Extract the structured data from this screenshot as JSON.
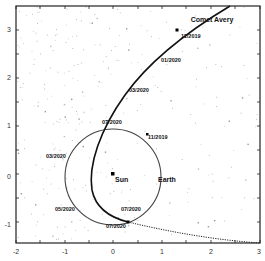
{
  "chart_data": {
    "type": "line",
    "title": "",
    "xlabel": "",
    "ylabel": "",
    "xlim": [
      -2,
      3
    ],
    "ylim": [
      -1.4,
      3.5
    ],
    "grid": false,
    "x_ticks": [
      "-2",
      "-1",
      "0",
      "1",
      "2",
      "3"
    ],
    "y_ticks": [
      "3",
      "2",
      "1",
      "0",
      "-1"
    ],
    "series": [
      {
        "name": "Comet Avery",
        "style": "solid-thick",
        "points": [
          [
            2.4,
            3.5
          ],
          [
            1.5,
            2.9
          ],
          [
            0.7,
            2.25
          ],
          [
            0.1,
            1.7
          ],
          [
            -0.3,
            1.0
          ],
          [
            -0.5,
            0.3
          ],
          [
            -0.45,
            -0.3
          ],
          [
            -0.2,
            -0.65
          ],
          [
            0.15,
            -0.95
          ]
        ]
      },
      {
        "name": "Comet Avery (future)",
        "style": "dotted",
        "points": [
          [
            0.15,
            -0.95
          ],
          [
            1.0,
            -1.15
          ],
          [
            2.0,
            -1.3
          ],
          [
            3.0,
            -1.35
          ]
        ]
      },
      {
        "name": "Earth orbit",
        "style": "circle",
        "center": [
          0,
          0
        ],
        "radius": 1.0
      }
    ],
    "annotations": [
      {
        "text": "Comet Avery",
        "x": 1.55,
        "y": 3.15
      },
      {
        "text": "11/2019",
        "x": 1.55,
        "y": 2.85
      },
      {
        "text": "01/2020",
        "x": 0.75,
        "y": 2.05
      },
      {
        "text": "03/2020",
        "x": 0.15,
        "y": 1.45
      },
      {
        "text": "07/2020",
        "x": -0.2,
        "y": 0.85
      },
      {
        "text": "11/2019",
        "x": 0.75,
        "y": 0.6
      },
      {
        "text": "03/2020",
        "x": -1.5,
        "y": 0.35
      },
      {
        "text": "Sun",
        "x": 0.05,
        "y": -0.05
      },
      {
        "text": "Earth",
        "x": 0.8,
        "y": -0.05
      },
      {
        "text": "05/2020",
        "x": -1.35,
        "y": -0.75
      },
      {
        "text": "07/2020",
        "x": 0.2,
        "y": -0.8
      },
      {
        "text": "07/2020",
        "x": -0.1,
        "y": -1.05
      }
    ],
    "markers": [
      {
        "name": "Sun",
        "x": 0,
        "y": 0.05
      },
      {
        "name": "Earth 11/2019",
        "x": 0.7,
        "y": 0.7
      },
      {
        "name": "Comet 11/2019",
        "x": 1.5,
        "y": 2.95
      },
      {
        "name": "Intersection 07/2020",
        "x": 0.3,
        "y": -0.95
      }
    ],
    "background": "starfield"
  }
}
